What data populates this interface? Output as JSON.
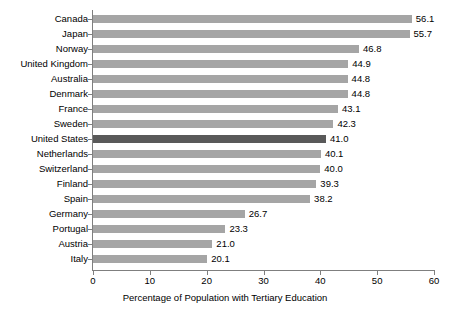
{
  "chart_data": {
    "type": "bar",
    "orientation": "horizontal",
    "title": "",
    "xlabel": "Percentage of Population with Tertiary Education",
    "ylabel": "",
    "xlim": [
      0,
      60
    ],
    "xticks": [
      0,
      10,
      20,
      30,
      40,
      50,
      60
    ],
    "grid": false,
    "legend": null,
    "categories": [
      "Canada",
      "Japan",
      "Norway",
      "United Kingdom",
      "Australia",
      "Denmark",
      "France",
      "Sweden",
      "United States",
      "Netherlands",
      "Switzerland",
      "Finland",
      "Spain",
      "Germany",
      "Portugal",
      "Austria",
      "Italy"
    ],
    "values": [
      56.1,
      55.7,
      46.8,
      44.9,
      44.8,
      44.8,
      43.1,
      42.3,
      41.0,
      40.1,
      40.0,
      39.3,
      38.2,
      26.7,
      23.3,
      21.0,
      20.1
    ],
    "value_labels": [
      "56.1",
      "55.7",
      "46.8",
      "44.9",
      "44.8",
      "44.8",
      "43.1",
      "42.3",
      "41.0",
      "40.1",
      "40.0",
      "39.3",
      "38.2",
      "26.7",
      "23.3",
      "21.0",
      "20.1"
    ],
    "highlighted_category": "United States",
    "colors": {
      "bar": "#a5a5a5",
      "bar_highlight": "#595959",
      "axis": "#7f7f7f",
      "text": "#000000",
      "background": "#ffffff"
    }
  }
}
